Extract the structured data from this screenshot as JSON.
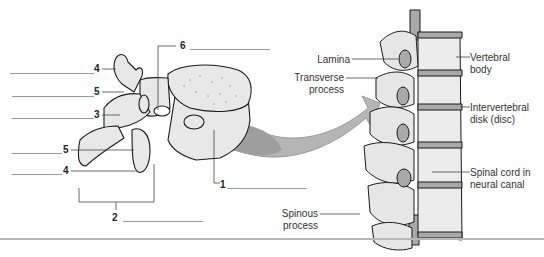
{
  "figure": {
    "type": "anatomy-labeling-diagram",
    "left_panel": {
      "subject": "single lumbar vertebra (superolateral view)",
      "numbered_labels": [
        {
          "id": "label-6",
          "number": "6",
          "answer_blank": true
        },
        {
          "id": "label-4-top",
          "number": "4",
          "answer_blank": true
        },
        {
          "id": "label-5-top",
          "number": "5",
          "answer_blank": true
        },
        {
          "id": "label-3",
          "number": "3",
          "answer_blank": true
        },
        {
          "id": "label-5-bottom",
          "number": "5",
          "answer_blank": true
        },
        {
          "id": "label-4-bottom",
          "number": "4",
          "answer_blank": true
        },
        {
          "id": "label-1",
          "number": "1",
          "answer_blank": true
        },
        {
          "id": "label-2",
          "number": "2",
          "answer_blank": true
        }
      ]
    },
    "right_panel": {
      "subject": "vertebral column segment (lateral view)",
      "labels": {
        "lamina": "Lamina",
        "transverse_line1": "Transverse",
        "transverse_line2": "process",
        "spinous_line1": "Spinous",
        "spinous_line2": "process",
        "vertebral_line1": "Vertebral",
        "vertebral_line2": "body",
        "disk_line1": "Intervertebral",
        "disk_line2": "disk (disc)",
        "cord_line1": "Spinal cord in",
        "cord_line2": "neural canal"
      }
    },
    "colors": {
      "bone_fill": "#e8e8e8",
      "outline": "#1a1a1a",
      "disk_fill": "#a9a9a9",
      "arrow_fill": "#b5b5b5",
      "leader_line": "#555555",
      "blank_line": "#9a9a9a",
      "divider": "#b8b8b8"
    }
  }
}
